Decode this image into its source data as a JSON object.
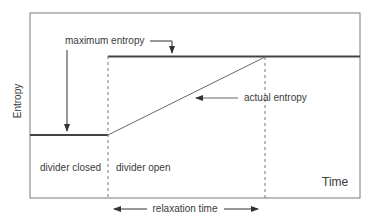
{
  "diagram": {
    "axis_labels": {
      "y": "Entropy",
      "x": "Time"
    },
    "annotations": {
      "maximum_entropy": "maximum entropy",
      "actual_entropy": "actual entropy",
      "relaxation_time": "relaxation time"
    },
    "regions": {
      "left": "divider closed",
      "right": "divider open"
    },
    "colors": {
      "line": "#555555",
      "thick_line": "#444444",
      "text": "#3a3a3a",
      "frame": "#7a7a7a"
    }
  }
}
